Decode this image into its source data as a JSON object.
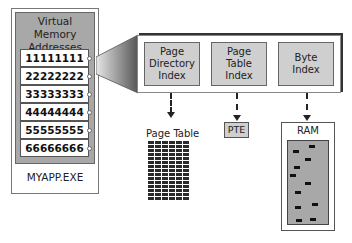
{
  "process": {
    "title_line1": "Virtual Memory",
    "title_line2": "Addresses",
    "name": "MYAPP.EXE",
    "addresses": [
      "11111111",
      "22222222",
      "33333333",
      "44444444",
      "55555555",
      "66666666"
    ]
  },
  "address_breakdown": {
    "fields": [
      {
        "line1": "Page",
        "line2": "Directory",
        "line3": "Index"
      },
      {
        "line1": "Page",
        "line2": "Table",
        "line3": "Index"
      },
      {
        "line1": "Byte",
        "line2": "Index",
        "line3": ""
      }
    ]
  },
  "targets": {
    "page_table_label": "Page Table",
    "page_table_rows": 15,
    "page_table_cols": 6,
    "pte_label": "PTE",
    "ram_label": "RAM",
    "ram_pages": [
      {
        "x": 309,
        "y": 145
      },
      {
        "x": 293,
        "y": 150
      },
      {
        "x": 305,
        "y": 158
      },
      {
        "x": 294,
        "y": 166
      },
      {
        "x": 290,
        "y": 174
      },
      {
        "x": 305,
        "y": 182
      },
      {
        "x": 295,
        "y": 191
      },
      {
        "x": 312,
        "y": 203
      },
      {
        "x": 295,
        "y": 206
      },
      {
        "x": 296,
        "y": 219
      },
      {
        "x": 310,
        "y": 218
      }
    ]
  },
  "colors": {
    "panel_grey": "#a8a8a8",
    "field_grey": "#cfcfcf",
    "dark": "#222222"
  }
}
